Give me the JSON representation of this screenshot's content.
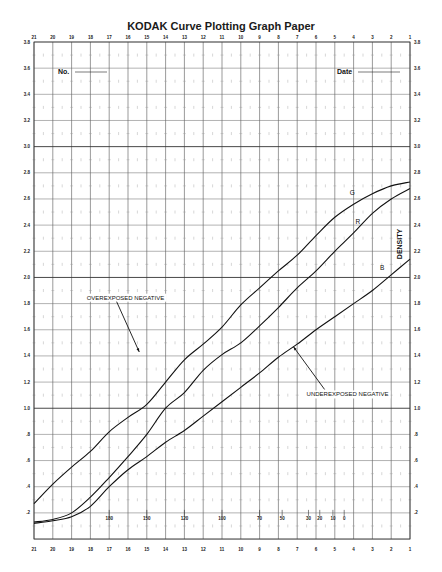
{
  "chart_data": {
    "type": "line",
    "title": "KODAK Curve Plotting Graph Paper",
    "xlabel": "",
    "ylabel": "DENSITY",
    "x_ticks_top": [
      21,
      20,
      19,
      18,
      17,
      16,
      15,
      14,
      13,
      12,
      11,
      10,
      9,
      8,
      7,
      6,
      5,
      4,
      3,
      2,
      1
    ],
    "x_ticks_bottom": [
      21,
      20,
      19,
      18,
      17,
      16,
      15,
      14,
      13,
      12,
      11,
      10,
      9,
      8,
      7,
      6,
      5,
      4,
      3,
      2,
      1
    ],
    "y_ticks": [
      "3.8",
      "3.6",
      "3.4",
      "3.2",
      "3.0",
      "2.8",
      "2.6",
      "2.4",
      "2.2",
      "2.0",
      "1.8",
      "1.6",
      "1.4",
      "1.2",
      "1.0",
      ".8",
      ".6",
      ".4",
      ".2"
    ],
    "secondary_scale": {
      "y": 0.2,
      "labels": [
        {
          "x": 17,
          "text": "180"
        },
        {
          "x": 15,
          "text": "150"
        },
        {
          "x": 13,
          "text": "120"
        },
        {
          "x": 11,
          "text": "100"
        },
        {
          "x": 9,
          "text": "70"
        },
        {
          "x": 7.8,
          "text": "50"
        },
        {
          "x": 6.4,
          "text": "30"
        },
        {
          "x": 5.8,
          "text": "20"
        },
        {
          "x": 5.1,
          "text": "10"
        },
        {
          "x": 4.5,
          "text": "0"
        }
      ]
    },
    "xlim": [
      21,
      1
    ],
    "ylim": [
      0,
      3.8
    ],
    "grid": true,
    "legend": "inline labels",
    "x": [
      21,
      20,
      19,
      18,
      17,
      16,
      15,
      14,
      13,
      12,
      11,
      10,
      9,
      8,
      7,
      6,
      5,
      4,
      3,
      2,
      1
    ],
    "series": [
      {
        "name": "G",
        "values": [
          0.27,
          0.42,
          0.55,
          0.67,
          0.82,
          0.93,
          1.03,
          1.2,
          1.37,
          1.49,
          1.62,
          1.79,
          1.92,
          2.05,
          2.17,
          2.32,
          2.46,
          2.56,
          2.64,
          2.7,
          2.73
        ]
      },
      {
        "name": "R",
        "values": [
          0.13,
          0.15,
          0.2,
          0.32,
          0.47,
          0.63,
          0.8,
          1.0,
          1.12,
          1.29,
          1.41,
          1.5,
          1.63,
          1.77,
          1.92,
          2.05,
          2.2,
          2.34,
          2.49,
          2.6,
          2.68
        ]
      },
      {
        "name": "B",
        "values": [
          0.12,
          0.14,
          0.17,
          0.25,
          0.4,
          0.53,
          0.63,
          0.74,
          0.83,
          0.94,
          1.05,
          1.16,
          1.27,
          1.39,
          1.49,
          1.6,
          1.7,
          1.8,
          1.9,
          2.02,
          2.14
        ]
      }
    ],
    "curve_labels": [
      {
        "name": "G",
        "x": 4.2,
        "y": 2.63
      },
      {
        "name": "R",
        "x": 3.9,
        "y": 2.41
      },
      {
        "name": "B",
        "x": 2.6,
        "y": 2.06
      }
    ],
    "annotations": [
      {
        "text": "OVEREXPOSED NEGATIVE",
        "text_x": 18.2,
        "text_y": 1.83,
        "arrow_to_x": 15.4,
        "arrow_to_y": 1.43
      },
      {
        "text": "UNDEREXPOSED NEGATIVE",
        "text_x": 6.5,
        "text_y": 1.09,
        "arrow_to_x": 7.2,
        "arrow_to_y": 1.47
      }
    ]
  },
  "header": {
    "title": "KODAK Curve Plotting Graph Paper",
    "no_label": "No.",
    "date_label": "Date"
  },
  "axis": {
    "density_label": "DENSITY"
  }
}
